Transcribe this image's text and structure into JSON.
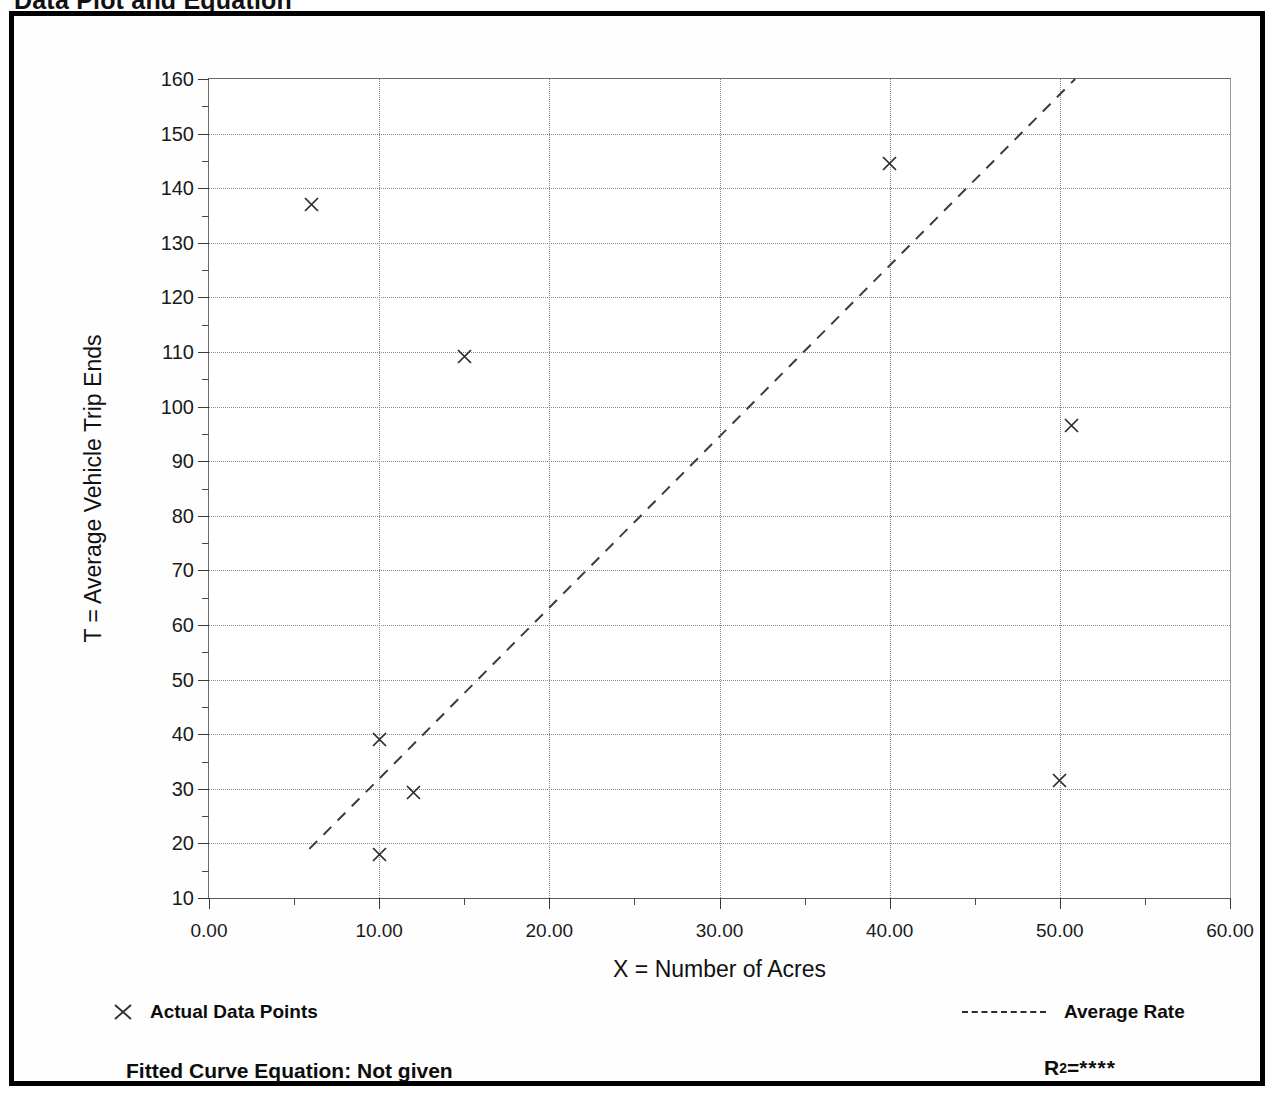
{
  "page": {
    "title": "Data Plot and Equation"
  },
  "legend": {
    "points_label": "Actual Data Points",
    "points_marker": "x-cross-icon",
    "rate_label": "Average Rate",
    "rate_marker": "dashed-line-icon",
    "equation_label": "Fitted Curve Equation:  Not given",
    "r2_symbol": "R",
    "r2_exponent": "2",
    "r2_equals": " = ",
    "r2_value": "****"
  },
  "chart_data": {
    "type": "scatter",
    "title": "Data Plot and Equation",
    "xlabel": "X = Number of Acres",
    "ylabel": "T = Average Vehicle Trip Ends",
    "xlim": [
      0,
      60
    ],
    "ylim": [
      10,
      160
    ],
    "xticks": [
      0,
      10,
      20,
      30,
      40,
      50,
      60
    ],
    "xtick_labels": [
      "0.00",
      "10.00",
      "20.00",
      "30.00",
      "40.00",
      "50.00",
      "60.00"
    ],
    "yticks": [
      10,
      20,
      30,
      40,
      50,
      60,
      70,
      80,
      90,
      100,
      110,
      120,
      130,
      140,
      150,
      160
    ],
    "ytick_labels": [
      "10",
      "20",
      "30",
      "40",
      "50",
      "60",
      "70",
      "80",
      "90",
      "100",
      "110",
      "120",
      "130",
      "140",
      "150",
      "160"
    ],
    "x_minor_interval": 5,
    "y_minor_interval": 5,
    "grid": true,
    "grid_style": "dotted",
    "legend_position": "below-plot",
    "series": [
      {
        "name": "Actual Data Points",
        "marker": "x",
        "points": [
          {
            "x": 6.0,
            "y": 137.0
          },
          {
            "x": 15.0,
            "y": 109.2
          },
          {
            "x": 40.0,
            "y": 144.5
          },
          {
            "x": 50.7,
            "y": 96.5
          },
          {
            "x": 10.0,
            "y": 39.0
          },
          {
            "x": 12.0,
            "y": 29.3
          },
          {
            "x": 10.0,
            "y": 18.0
          },
          {
            "x": 50.0,
            "y": 31.5
          }
        ]
      },
      {
        "name": "Average Rate",
        "type": "line",
        "style": "dashed",
        "endpoints": [
          {
            "x": 5.9,
            "y": 19.0
          },
          {
            "x": 50.9,
            "y": 160.0
          }
        ]
      }
    ]
  }
}
